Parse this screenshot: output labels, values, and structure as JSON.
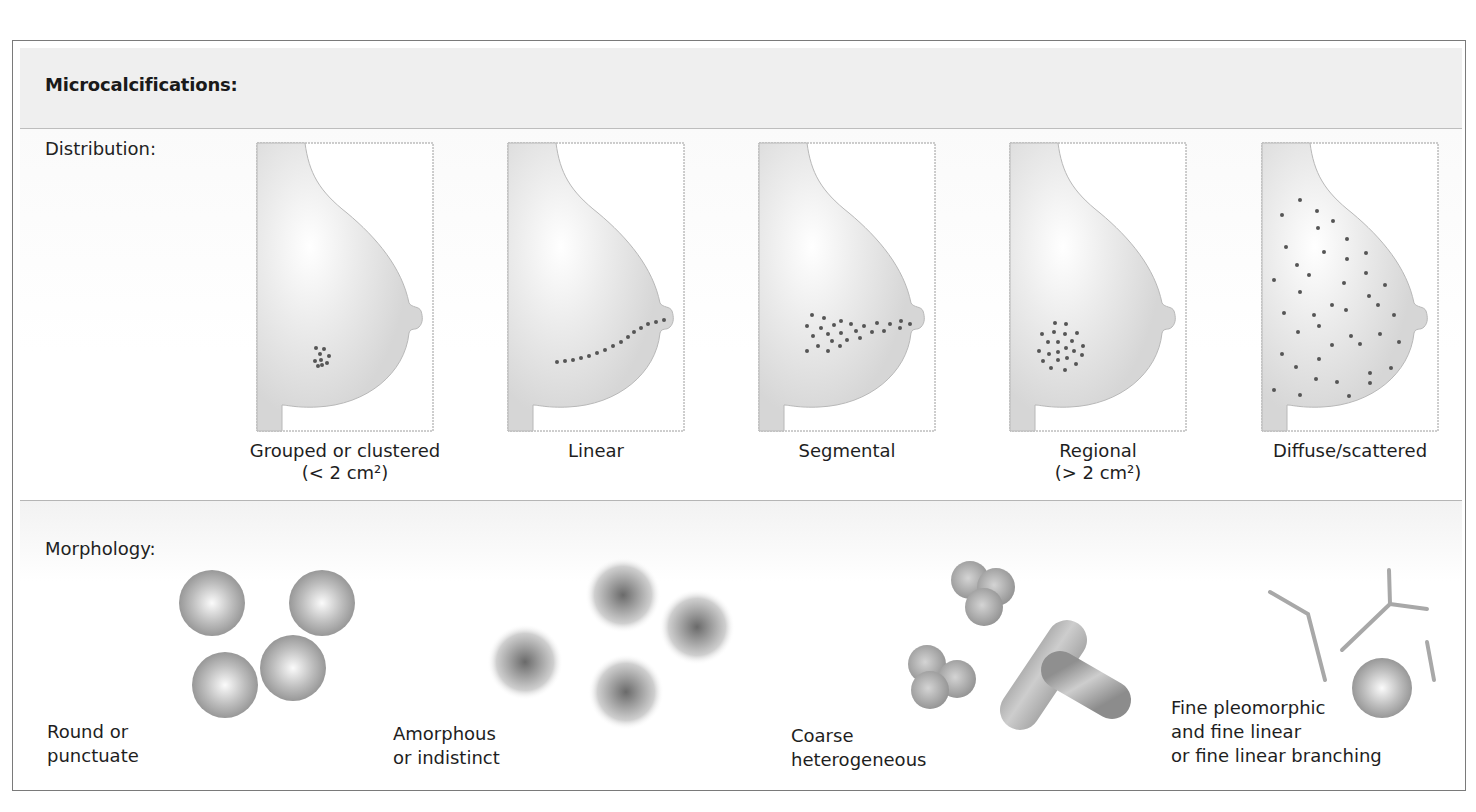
{
  "title": "Microcalcifications:",
  "sections": {
    "distribution": {
      "label": "Distribution:"
    },
    "morphology": {
      "label": "Morphology:"
    }
  },
  "colors": {
    "frame": "#7a7a7a",
    "header_bg": "#efefef",
    "breast_fill": "#dcdcdc",
    "breast_highlight": "#ffffff",
    "dot": "#555555",
    "sphere_dark": "#8a8a8a",
    "line": "#a8a8a8"
  },
  "distribution": [
    {
      "id": "grouped",
      "label_line1": "Grouped or clustered",
      "label_line2": "(< 2 cm²)",
      "x": 257
    },
    {
      "id": "linear",
      "label_line1": "Linear",
      "label_line2": "",
      "x": 508
    },
    {
      "id": "segmental",
      "label_line1": "Segmental",
      "label_line2": "",
      "x": 759
    },
    {
      "id": "regional",
      "label_line1": "Regional",
      "label_line2": "(> 2 cm²)",
      "x": 1010
    },
    {
      "id": "diffuse",
      "label_line1": "Diffuse/scattered",
      "label_line2": "",
      "x": 1262
    }
  ],
  "morphology": [
    {
      "id": "round",
      "label_line1": "Round or",
      "label_line2": "punctuate",
      "label_line3": ""
    },
    {
      "id": "amorphous",
      "label_line1": "Amorphous",
      "label_line2": "or indistinct",
      "label_line3": ""
    },
    {
      "id": "coarse",
      "label_line1": "Coarse",
      "label_line2": "heterogeneous",
      "label_line3": ""
    },
    {
      "id": "fine",
      "label_line1": "Fine pleomorphic",
      "label_line2": "and fine linear",
      "label_line3": "or fine linear branching"
    }
  ]
}
